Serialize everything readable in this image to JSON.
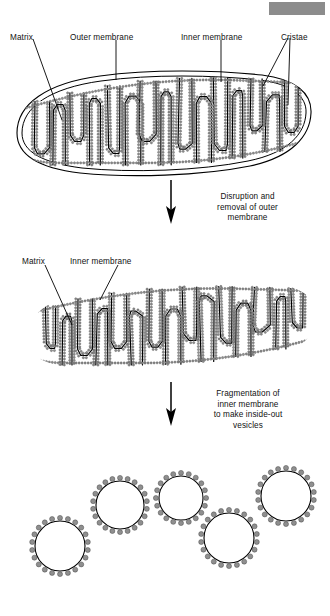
{
  "figure": {
    "background_color": "#ffffff",
    "ink_color": "#000000",
    "particle_color": "#8f8f8f",
    "particle_outline_color": "#4a4a4a",
    "redaction_color": "#8c8c8c"
  },
  "stage1": {
    "name": "Intact mitochondrion",
    "labels": {
      "matrix": "Matrix",
      "outer_membrane": "Outer membrane",
      "inner_membrane": "Inner membrane",
      "cristae": "Cristae"
    }
  },
  "arrow1": {
    "line1": "Disruption and",
    "line2": "removal of outer",
    "line3": "membrane"
  },
  "stage2": {
    "name": "Inner membrane preparation",
    "labels": {
      "matrix": "Matrix",
      "inner_membrane": "Inner membrane"
    }
  },
  "arrow2": {
    "line1": "Fragmentation of",
    "line2": "inner membrane",
    "line3": "to make inside-out",
    "line4": "vesicles"
  },
  "stage3": {
    "name": "Inside-out vesicles",
    "vesicle_count": 5,
    "vesicles": [
      {
        "cx": 60,
        "cy": 546,
        "r": 25,
        "particles": 22
      },
      {
        "cx": 120,
        "cy": 505,
        "r": 24,
        "particles": 22
      },
      {
        "cx": 181,
        "cy": 498,
        "r": 22,
        "particles": 20
      },
      {
        "cx": 229,
        "cy": 538,
        "r": 25,
        "particles": 22
      },
      {
        "cx": 286,
        "cy": 496,
        "r": 25,
        "particles": 22
      }
    ]
  }
}
